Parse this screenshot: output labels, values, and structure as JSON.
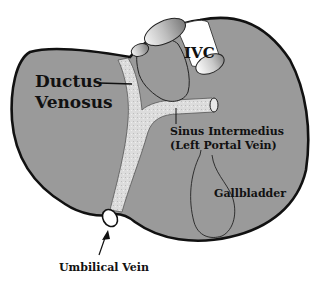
{
  "diagram": {
    "colors": {
      "liver_fill": "#9a9a9a",
      "outline": "#111111",
      "vessel_fill": "#d8d8d8",
      "background": "#ffffff"
    },
    "labels": {
      "ivc": "IVC",
      "ductus_line1": "Ductus",
      "ductus_line2": "Venosus",
      "sinus_line1": "Sinus Intermedius",
      "sinus_line2": "(Left Portal Vein)",
      "gallbladder": "Gallbladder",
      "umbilical": "Umbilical Vein"
    }
  }
}
